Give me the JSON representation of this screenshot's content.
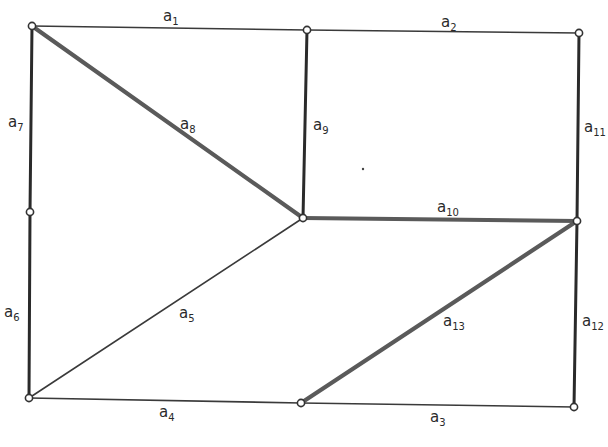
{
  "diagram": {
    "type": "graph",
    "nodes": [
      {
        "id": "n1",
        "x": 32,
        "y": 26
      },
      {
        "id": "n2",
        "x": 307,
        "y": 30
      },
      {
        "id": "n3",
        "x": 579,
        "y": 33
      },
      {
        "id": "n4",
        "x": 30,
        "y": 212
      },
      {
        "id": "n5",
        "x": 303,
        "y": 218
      },
      {
        "id": "n6",
        "x": 577,
        "y": 221
      },
      {
        "id": "n7",
        "x": 29,
        "y": 398
      },
      {
        "id": "n8",
        "x": 301,
        "y": 403
      },
      {
        "id": "n9",
        "x": 574,
        "y": 407
      }
    ],
    "edges": [
      {
        "id": "a1",
        "label": "a",
        "sub": "1",
        "from": "n1",
        "to": "n2",
        "weight": "thin",
        "lx": 163,
        "ly": 21
      },
      {
        "id": "a2",
        "label": "a",
        "sub": "2",
        "from": "n2",
        "to": "n3",
        "weight": "thin",
        "lx": 441,
        "ly": 27
      },
      {
        "id": "a3",
        "label": "a",
        "sub": "3",
        "from": "n8",
        "to": "n9",
        "weight": "thin",
        "lx": 430,
        "ly": 422
      },
      {
        "id": "a4",
        "label": "a",
        "sub": "4",
        "from": "n7",
        "to": "n8",
        "weight": "thin",
        "lx": 159,
        "ly": 417
      },
      {
        "id": "a5",
        "label": "a",
        "sub": "5",
        "from": "n7",
        "to": "n5",
        "weight": "thin",
        "lx": 179,
        "ly": 318
      },
      {
        "id": "a6",
        "label": "a",
        "sub": "6",
        "from": "n4",
        "to": "n7",
        "weight": "medium",
        "lx": 4,
        "ly": 317
      },
      {
        "id": "a7",
        "label": "a",
        "sub": "7",
        "from": "n1",
        "to": "n4",
        "weight": "medium",
        "lx": 8,
        "ly": 127
      },
      {
        "id": "a8",
        "label": "a",
        "sub": "8",
        "from": "n1",
        "to": "n5",
        "weight": "thick",
        "lx": 180,
        "ly": 129
      },
      {
        "id": "a9",
        "label": "a",
        "sub": "9",
        "from": "n2",
        "to": "n5",
        "weight": "medium",
        "lx": 313,
        "ly": 130
      },
      {
        "id": "a10",
        "label": "a",
        "sub": "10",
        "from": "n5",
        "to": "n6",
        "weight": "thick",
        "lx": 437,
        "ly": 212
      },
      {
        "id": "a11",
        "label": "a",
        "sub": "11",
        "from": "n3",
        "to": "n6",
        "weight": "medium",
        "lx": 584,
        "ly": 132
      },
      {
        "id": "a12",
        "label": "a",
        "sub": "12",
        "from": "n6",
        "to": "n9",
        "weight": "medium",
        "lx": 582,
        "ly": 326
      },
      {
        "id": "a13",
        "label": "a",
        "sub": "13",
        "from": "n8",
        "to": "n6",
        "weight": "thick",
        "lx": 443,
        "ly": 326
      }
    ],
    "dots": [
      {
        "x": 363,
        "y": 169
      }
    ]
  }
}
